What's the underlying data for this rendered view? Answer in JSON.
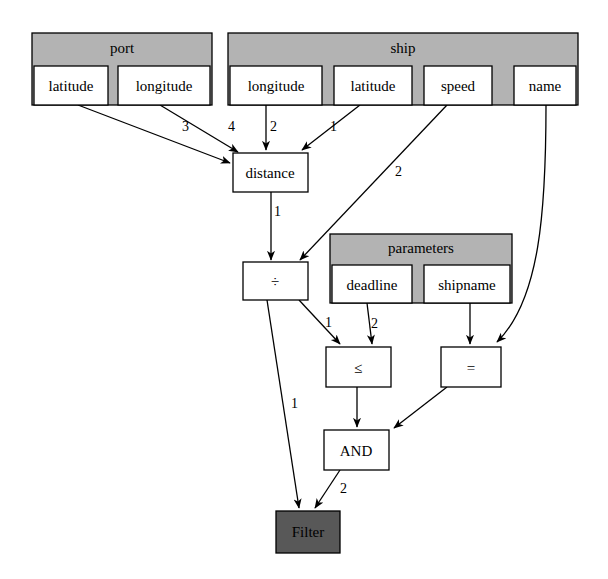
{
  "diagram": {
    "colors": {
      "table_header_fill": "#b3b3b3",
      "node_fill": "#ffffff",
      "sink_fill": "#585858",
      "stroke": "#000000",
      "background": "#ffffff"
    },
    "tables": [
      {
        "id": "port",
        "name": "port",
        "columns": [
          {
            "id": "port_latitude",
            "label": "latitude"
          },
          {
            "id": "port_longitude",
            "label": "longitude"
          }
        ]
      },
      {
        "id": "ship",
        "name": "ship",
        "columns": [
          {
            "id": "ship_longitude",
            "label": "longitude"
          },
          {
            "id": "ship_latitude",
            "label": "latitude"
          },
          {
            "id": "ship_speed",
            "label": "speed"
          },
          {
            "id": "ship_name",
            "label": "name"
          }
        ]
      },
      {
        "id": "parameters",
        "name": "parameters",
        "columns": [
          {
            "id": "param_deadline",
            "label": "deadline"
          },
          {
            "id": "param_shipname",
            "label": "shipname"
          }
        ]
      }
    ],
    "operators": [
      {
        "id": "distance",
        "label": "distance"
      },
      {
        "id": "divide",
        "label": "÷"
      },
      {
        "id": "leq",
        "label": "≤"
      },
      {
        "id": "eq",
        "label": "="
      },
      {
        "id": "and",
        "label": "AND"
      }
    ],
    "sink": {
      "id": "filter",
      "label": "Filter"
    },
    "edges": [
      {
        "id": "e1",
        "from": "port_latitude",
        "to": "distance",
        "label": "3"
      },
      {
        "id": "e2",
        "from": "port_longitude",
        "to": "distance",
        "label": "4"
      },
      {
        "id": "e3",
        "from": "ship_longitude",
        "to": "distance",
        "label": "2"
      },
      {
        "id": "e4",
        "from": "ship_latitude",
        "to": "distance",
        "label": "1"
      },
      {
        "id": "e5",
        "from": "distance",
        "to": "divide",
        "label": "1"
      },
      {
        "id": "e6",
        "from": "ship_speed",
        "to": "divide",
        "label": "2"
      },
      {
        "id": "e7",
        "from": "divide",
        "to": "leq",
        "label": "1"
      },
      {
        "id": "e8",
        "from": "param_deadline",
        "to": "leq",
        "label": "2"
      },
      {
        "id": "e9",
        "from": "param_shipname",
        "to": "eq",
        "label": ""
      },
      {
        "id": "e10",
        "from": "ship_name",
        "to": "eq",
        "label": ""
      },
      {
        "id": "e11",
        "from": "leq",
        "to": "and",
        "label": ""
      },
      {
        "id": "e12",
        "from": "eq",
        "to": "and",
        "label": ""
      },
      {
        "id": "e13",
        "from": "divide",
        "to": "filter",
        "label": "1"
      },
      {
        "id": "e14",
        "from": "and",
        "to": "filter",
        "label": "2"
      }
    ]
  }
}
